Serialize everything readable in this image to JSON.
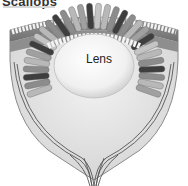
{
  "figure": {
    "title": "Scallops",
    "subtitle": "",
    "labels": {
      "lens": "Lens"
    }
  },
  "colors": {
    "background": "#ffffff",
    "outer_band": "#7a7a7a",
    "cornea_cells": "#f2f2f2",
    "lens_fill": "#f4f4f4",
    "retina_light": "#b8b8b8",
    "retina_mid": "#8c8c8c",
    "retina_dark": "#3e3e3e",
    "nerve": "#555555"
  }
}
